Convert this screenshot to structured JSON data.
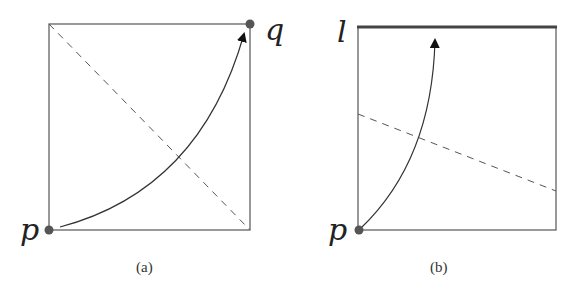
{
  "figure": {
    "panels": [
      {
        "id": "a",
        "caption": "(a)",
        "labels": {
          "start": "p",
          "end": "q"
        },
        "square": {
          "x": 49,
          "y": 24,
          "w": 201,
          "h": 206
        },
        "start_point": {
          "x": 49,
          "y": 230
        },
        "end_point": {
          "x": 250,
          "y": 24
        },
        "dashed_line": {
          "x1": 49,
          "y1": 24,
          "x2": 250,
          "y2": 230
        },
        "arrow_curve": "M 60 227 Q 200 190 246 30"
      },
      {
        "id": "b",
        "caption": "(b)",
        "labels": {
          "start": "p",
          "target_line": "l"
        },
        "square": {
          "x": 358,
          "y": 27,
          "w": 198,
          "h": 203
        },
        "start_point": {
          "x": 359,
          "y": 230
        },
        "target_line": {
          "x1": 358,
          "y1": 27,
          "x2": 556,
          "y2": 27
        },
        "dashed_line": {
          "x1": 358,
          "y1": 114,
          "x2": 556,
          "y2": 191
        },
        "arrow_curve": "M 360 228 Q 430 160 435 32"
      }
    ],
    "colors": {
      "stroke": "#555555",
      "dot": "#555555",
      "thick_line": "#444444",
      "arrowhead": "#111111",
      "text": "#222222"
    }
  }
}
